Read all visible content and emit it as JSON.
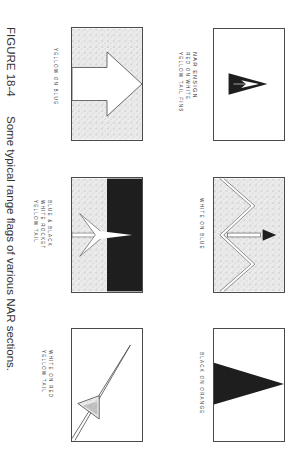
{
  "figure": {
    "label": "FIGURE 18-4",
    "caption": "Some typical range flags of various NAR sections.",
    "orientation": "rotated 90° clockwise"
  },
  "flags": [
    {
      "id": "nar-ensign",
      "lines": [
        "NAR ENSIGN",
        "RED ON WHITE",
        "YELLOW TAIL FINS"
      ],
      "pennant_text": "NAR"
    },
    {
      "id": "white-on-blue",
      "lines": [
        "WHITE ON BLUE"
      ]
    },
    {
      "id": "black-on-orange",
      "lines": [
        "BLACK ON ORANGE"
      ]
    },
    {
      "id": "yellow-on-blue",
      "lines": [
        "YELLOW ON BLUE"
      ]
    },
    {
      "id": "blue-black",
      "lines": [
        "BLUE & BLACK",
        "WHITE ROCKET",
        "YELLOW TAIL"
      ]
    },
    {
      "id": "white-on-red",
      "lines": [
        "WHITE ON RED",
        "YELLOW TAIL"
      ]
    }
  ],
  "colors": {
    "ink": "#2a2a2a",
    "stipple_bg": "#e6e6e6",
    "solid_dark": "#1e1e1e",
    "paper": "#ffffff"
  }
}
